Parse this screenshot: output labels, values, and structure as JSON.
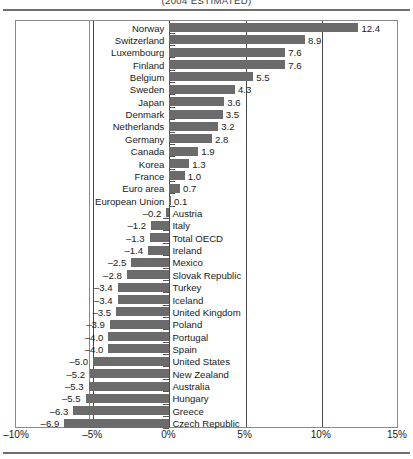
{
  "chart_title": "(2004 ESTIMATED)",
  "chart_data": {
    "type": "bar",
    "orientation": "horizontal",
    "title": "(2004 ESTIMATED)",
    "xlabel": "",
    "ylabel": "",
    "xlim": [
      -10,
      15
    ],
    "xticks": [
      -10,
      -5,
      0,
      5,
      10,
      15
    ],
    "xtick_labels": [
      "–10%",
      "–5%",
      "0%",
      "5%",
      "10%",
      "15%"
    ],
    "grid": true,
    "legend": "none",
    "bar_color": "#6b6b6b",
    "categories": [
      "Norway",
      "Switzerland",
      "Luxembourg",
      "Finland",
      "Belgium",
      "Sweden",
      "Japan",
      "Denmark",
      "Netherlands",
      "Germany",
      "Canada",
      "Korea",
      "France",
      "Euro area",
      "European Union",
      "Austria",
      "Italy",
      "Total OECD",
      "Ireland",
      "Mexico",
      "Slovak Republic",
      "Turkey",
      "Iceland",
      "United Kingdom",
      "Poland",
      "Portugal",
      "Spain",
      "United States",
      "New Zealand",
      "Australia",
      "Hungary",
      "Greece",
      "Czech Republic"
    ],
    "values": [
      12.4,
      8.9,
      7.6,
      7.6,
      5.5,
      4.3,
      3.6,
      3.5,
      3.2,
      2.8,
      1.9,
      1.3,
      1.0,
      0.7,
      0.1,
      -0.2,
      -1.2,
      -1.3,
      -1.4,
      -2.5,
      -2.8,
      -3.4,
      -3.4,
      -3.5,
      -3.9,
      -4.0,
      -4.0,
      -5.0,
      -5.2,
      -5.3,
      -5.5,
      -6.3,
      -6.9
    ],
    "value_labels": [
      "12.4",
      "8.9",
      "7.6",
      "7.6",
      "5.5",
      "4.3",
      "3.6",
      "3.5",
      "3.2",
      "2.8",
      "1.9",
      "1.3",
      "1.0",
      "0.7",
      "0.1",
      "–0.2",
      "–1.2",
      "–1.3",
      "–1.4",
      "–2.5",
      "–2.8",
      "–3.4",
      "–3.4",
      "–3.5",
      "–3.9",
      "–4.0",
      "–4.0",
      "–5.0",
      "–5.2",
      "–5.3",
      "–5.5",
      "–6.3",
      "–6.9"
    ]
  }
}
